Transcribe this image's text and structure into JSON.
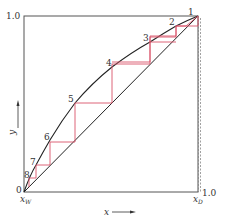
{
  "diagram": {
    "type": "McCabe-Thiele stage construction",
    "axes": {
      "x_label": "x",
      "y_label": "y",
      "y_top_tick": "1.0",
      "x_right_tick": "1.0",
      "origin_label": "0",
      "x_w_label": "x",
      "x_w_sub": "W",
      "x_d_label": "x",
      "x_d_sub": "D"
    },
    "stages": [
      {
        "label": "1"
      },
      {
        "label": "2"
      },
      {
        "label": "3"
      },
      {
        "label": "4"
      },
      {
        "label": "5"
      },
      {
        "label": "6"
      },
      {
        "label": "7"
      },
      {
        "label": "8"
      }
    ],
    "colors": {
      "frame": "#555555",
      "curve": "#222222",
      "steps": "#d9546a",
      "dashed": "#888888"
    }
  }
}
